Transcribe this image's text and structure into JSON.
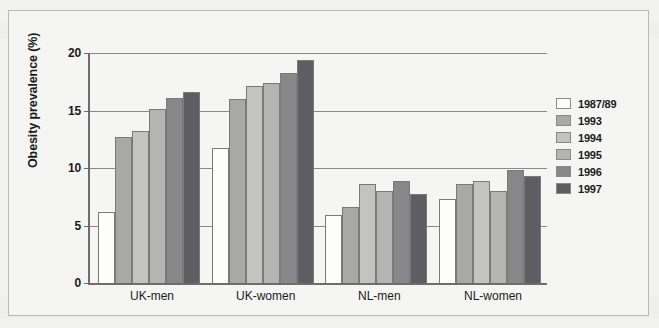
{
  "chart_data": {
    "type": "bar",
    "title": "",
    "xlabel": "",
    "ylabel": "Obesity prevalence (%)",
    "ylim": [
      0,
      20
    ],
    "yticks": [
      0,
      5,
      10,
      15,
      20
    ],
    "ytick_labels": [
      "0",
      "5",
      "10",
      "15",
      "20"
    ],
    "grid": true,
    "legend_position": "right",
    "categories": [
      "UK-men",
      "UK-women",
      "NL-men",
      "NL-women"
    ],
    "series": [
      {
        "name": "1987/89",
        "color": "#fdfdfb",
        "values": [
          6.2,
          11.7,
          5.9,
          7.3
        ]
      },
      {
        "name": "1993",
        "color": "#a8a8a6",
        "values": [
          12.7,
          16.0,
          6.6,
          8.6
        ]
      },
      {
        "name": "1994",
        "color": "#c3c3c1",
        "values": [
          13.2,
          17.1,
          8.6,
          8.9
        ]
      },
      {
        "name": "1995",
        "color": "#b4b4b2",
        "values": [
          15.1,
          17.4,
          8.0,
          8.0
        ]
      },
      {
        "name": "1996",
        "color": "#87878a",
        "values": [
          16.1,
          18.3,
          8.9,
          9.8
        ]
      },
      {
        "name": "1997",
        "color": "#5e5e62",
        "values": [
          16.6,
          19.4,
          7.7,
          9.3
        ]
      }
    ]
  }
}
